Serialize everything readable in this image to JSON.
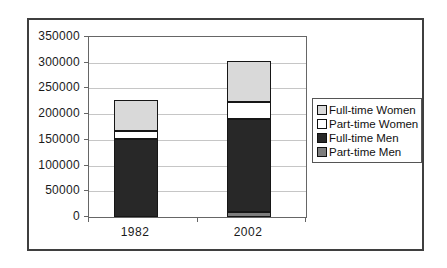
{
  "chart_data": {
    "type": "bar",
    "stacked": true,
    "title": "",
    "xlabel": "",
    "ylabel": "",
    "categories": [
      "1982",
      "2002"
    ],
    "series": [
      {
        "name": "Part-time Men",
        "color": "#7d7d7d",
        "values": [
          0,
          10000
        ]
      },
      {
        "name": "Full-time Men",
        "color": "#282828",
        "values": [
          152000,
          180000
        ]
      },
      {
        "name": "Part-time Women",
        "color": "#ffffff",
        "values": [
          16000,
          34000
        ]
      },
      {
        "name": "Full-time Women",
        "color": "#d9d9d9",
        "values": [
          60000,
          80000
        ]
      }
    ],
    "totals": {
      "1982": 228000,
      "2002": 304000
    },
    "ylim": [
      0,
      350000
    ],
    "ytick_interval": 50000,
    "yticks": [
      0,
      50000,
      100000,
      150000,
      200000,
      250000,
      300000,
      350000
    ],
    "ytick_labels": [
      "0",
      "50000",
      "100000",
      "150000",
      "200000",
      "250000",
      "300000",
      "350000"
    ],
    "grid": true,
    "legend": {
      "position": "right",
      "items": [
        {
          "label": "Full-time Women",
          "color": "#d9d9d9"
        },
        {
          "label": "Part-time Women",
          "color": "#ffffff"
        },
        {
          "label": "Full-time Men",
          "color": "#282828"
        },
        {
          "label": "Part-time Men",
          "color": "#7d7d7d"
        }
      ]
    }
  },
  "colors": {
    "page_background": "#ffffff",
    "frame_border": "#3f3f3f",
    "plot_border": "#666666",
    "gridline": "#c6c6c6",
    "segment_border": "#161616",
    "text": "#1a1a1a"
  }
}
